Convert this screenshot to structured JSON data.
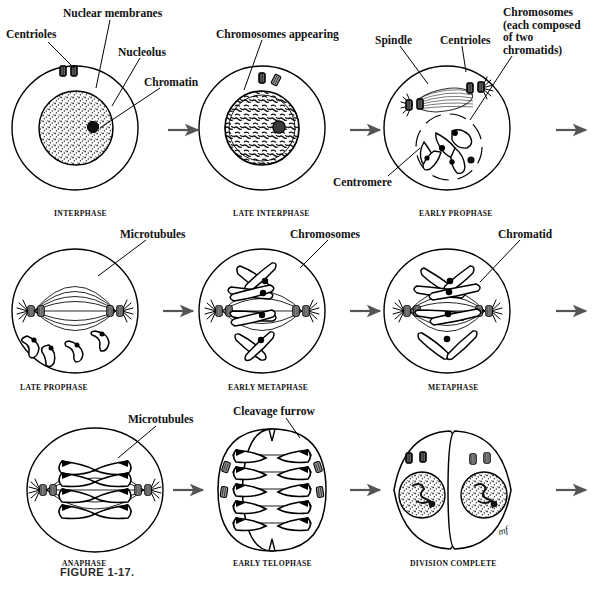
{
  "figure": {
    "caption": "FIGURE 1-17.",
    "signature": "mf"
  },
  "colors": {
    "ink": "#000000",
    "arrow": "#555555",
    "paper": "#ffffff",
    "centriole_fill": "#888888",
    "chromosome_fill": "#ffffff",
    "centromere": "#000000"
  },
  "callouts": [
    {
      "id": "centrioles-1",
      "text": "Centrioles",
      "x": 6,
      "y": 28,
      "leader": [
        [
          48,
          42
        ],
        [
          74,
          68
        ]
      ]
    },
    {
      "id": "nuclear-membranes",
      "text": "Nuclear membranes",
      "x": 63,
      "y": 7,
      "leader": [
        [
          110,
          20
        ],
        [
          96,
          88
        ]
      ]
    },
    {
      "id": "nucleolus",
      "text": "Nucleolus",
      "x": 118,
      "y": 46,
      "leader": [
        [
          140,
          58
        ],
        [
          112,
          106
        ]
      ]
    },
    {
      "id": "chromatin",
      "text": "Chromatin",
      "x": 144,
      "y": 76,
      "leader": [
        [
          160,
          88
        ],
        [
          100,
          128
        ]
      ]
    },
    {
      "id": "chromosomes-appearing",
      "text": "Chromosomes appearing",
      "x": 216,
      "y": 28,
      "leader": [
        [
          262,
          40
        ],
        [
          244,
          90
        ]
      ]
    },
    {
      "id": "spindle",
      "text": "Spindle",
      "x": 375,
      "y": 34,
      "leader": [
        [
          400,
          46
        ],
        [
          428,
          84
        ]
      ]
    },
    {
      "id": "centrioles-2",
      "text": "Centrioles",
      "x": 440,
      "y": 34,
      "leader": [
        [
          462,
          46
        ],
        [
          466,
          72
        ]
      ]
    },
    {
      "id": "chromosomes-two-chromatids",
      "text": "Chromosomes\n(each composed\nof two\nchromatids)",
      "x": 503,
      "y": 6,
      "leader": [
        [
          512,
          56
        ],
        [
          470,
          120
        ]
      ]
    },
    {
      "id": "centromere",
      "text": "Centromere",
      "x": 333,
      "y": 176,
      "leader": [
        [
          388,
          176
        ],
        [
          420,
          148
        ]
      ]
    },
    {
      "id": "microtubules-1",
      "text": "Microtubules",
      "x": 120,
      "y": 228,
      "leader": [
        [
          146,
          240
        ],
        [
          98,
          276
        ]
      ]
    },
    {
      "id": "chromosomes-2",
      "text": "Chromosomes",
      "x": 290,
      "y": 228,
      "leader": [
        [
          328,
          240
        ],
        [
          300,
          268
        ]
      ]
    },
    {
      "id": "chromatid",
      "text": "Chromatid",
      "x": 498,
      "y": 228,
      "leader": [
        [
          520,
          240
        ],
        [
          480,
          282
        ]
      ]
    },
    {
      "id": "microtubules-2",
      "text": "Microtubules",
      "x": 128,
      "y": 413,
      "leader": [
        [
          156,
          426
        ],
        [
          118,
          458
        ]
      ]
    },
    {
      "id": "cleavage-furrow",
      "text": "Cleavage furrow",
      "x": 233,
      "y": 405,
      "leader": [
        [
          286,
          418
        ],
        [
          300,
          438
        ]
      ]
    }
  ],
  "stages": [
    {
      "id": "interphase",
      "name": "INTERPHASE",
      "label_x": 54,
      "label_y": 209,
      "cx": 75,
      "cy": 128,
      "row": 1,
      "col": 1
    },
    {
      "id": "late-interphase",
      "name": "LATE INTERPHASE",
      "label_x": 233,
      "label_y": 209,
      "cx": 262,
      "cy": 128,
      "row": 1,
      "col": 2
    },
    {
      "id": "early-prophase",
      "name": "EARLY PROPHASE",
      "label_x": 419,
      "label_y": 209,
      "cx": 447,
      "cy": 128,
      "row": 1,
      "col": 3
    },
    {
      "id": "late-prophase",
      "name": "LATE PROPHASE",
      "label_x": 20,
      "label_y": 383,
      "cx": 75,
      "cy": 311,
      "row": 2,
      "col": 1
    },
    {
      "id": "early-metaphase",
      "name": "EARLY METAPHASE",
      "label_x": 228,
      "label_y": 383,
      "cx": 262,
      "cy": 311,
      "row": 2,
      "col": 2
    },
    {
      "id": "metaphase",
      "name": "METAPHASE",
      "label_x": 428,
      "label_y": 383,
      "cx": 447,
      "cy": 311,
      "row": 2,
      "col": 3
    },
    {
      "id": "anaphase",
      "name": "ANAPHASE",
      "label_x": 62,
      "label_y": 559,
      "cx": 95,
      "cy": 490,
      "row": 3,
      "col": 1
    },
    {
      "id": "early-telophase",
      "name": "EARLY TELOPHASE",
      "label_x": 233,
      "label_y": 559,
      "cx": 272,
      "cy": 490,
      "row": 3,
      "col": 2
    },
    {
      "id": "division-complete",
      "name": "DIVISION COMPLETE",
      "label_x": 410,
      "label_y": 559,
      "cx": 452,
      "cy": 490,
      "row": 3,
      "col": 3
    }
  ],
  "arrows": [
    {
      "id": "arrow-1",
      "x": 168,
      "y": 130,
      "len": 30
    },
    {
      "id": "arrow-2",
      "x": 350,
      "y": 130,
      "len": 30
    },
    {
      "id": "arrow-3",
      "x": 556,
      "y": 130,
      "len": 30
    },
    {
      "id": "arrow-4",
      "x": 163,
      "y": 311,
      "len": 30
    },
    {
      "id": "arrow-5",
      "x": 350,
      "y": 311,
      "len": 30
    },
    {
      "id": "arrow-6",
      "x": 556,
      "y": 311,
      "len": 30
    },
    {
      "id": "arrow-7",
      "x": 173,
      "y": 490,
      "len": 30
    },
    {
      "id": "arrow-8",
      "x": 350,
      "y": 490,
      "len": 30
    },
    {
      "id": "arrow-9",
      "x": 556,
      "y": 490,
      "len": 30
    }
  ]
}
